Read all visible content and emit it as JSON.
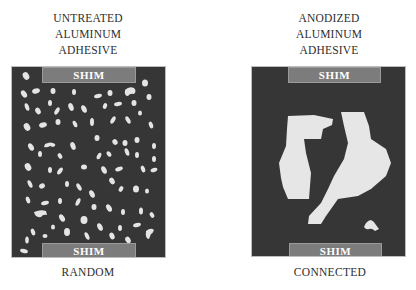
{
  "left": {
    "heading": [
      "UNTREATED",
      "ALUMINUM",
      "ADHESIVE"
    ],
    "top_shim_label": "SHIM",
    "bottom_shim_label": "SHIM",
    "caption": "RANDOM"
  },
  "right": {
    "heading": [
      "ANODIZED",
      "ALUMINUM",
      "ADHESIVE"
    ],
    "top_shim_label": "SHIM",
    "bottom_shim_label": "SHIM",
    "caption": "CONNECTED"
  },
  "colors": {
    "panel": "#363636",
    "shim": "#7c7c7c",
    "void": "#e6e6e6",
    "text": "#2e2e2e"
  }
}
